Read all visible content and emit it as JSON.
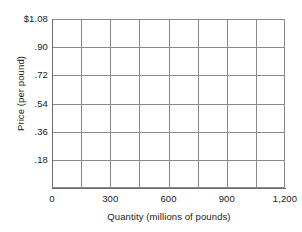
{
  "chart_data": {
    "type": "line",
    "title": "",
    "subtitle": "",
    "xlabel": "Quantity (millions of pounds)",
    "ylabel": "Price (per pound)",
    "xlim": [
      0,
      1200
    ],
    "ylim": [
      0,
      1.08
    ],
    "grid": true,
    "legend": null,
    "series": [],
    "annotations": [],
    "note": "Empty plotting grid — no data series are drawn in the figure.",
    "x_ticks": [
      {
        "value": 0,
        "label": "0"
      },
      {
        "value": 300,
        "label": "300"
      },
      {
        "value": 600,
        "label": "600"
      },
      {
        "value": 900,
        "label": "900"
      },
      {
        "value": 1200,
        "label": "1,200"
      }
    ],
    "y_ticks": [
      {
        "value": 1.08,
        "label": "$1.08"
      },
      {
        "value": 0.9,
        "label": ".90"
      },
      {
        "value": 0.72,
        "label": ".72"
      },
      {
        "value": 0.54,
        "label": ".54"
      },
      {
        "value": 0.36,
        "label": ".36"
      },
      {
        "value": 0.18,
        "label": ".18"
      },
      {
        "value": 0,
        "label": ""
      }
    ],
    "x_gridlines": [
      0,
      150,
      300,
      450,
      600,
      750,
      900,
      1050,
      1200
    ],
    "y_gridlines": [
      0,
      0.18,
      0.36,
      0.54,
      0.72,
      0.9,
      1.08
    ],
    "colors": {
      "grid": "#8a8a8a",
      "axis": "#6e6e6e",
      "text": "#1a1a1a",
      "background": "#ffffff"
    }
  }
}
